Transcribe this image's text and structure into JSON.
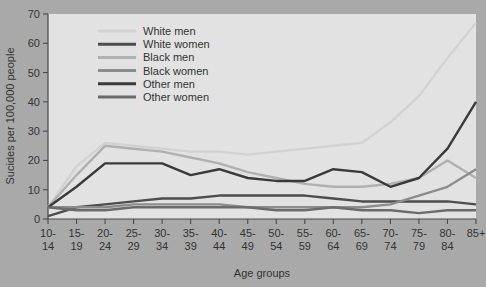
{
  "chart_data": {
    "type": "line",
    "title": "",
    "xlabel": "Age groups",
    "ylabel": "Sucides per 100,000 people",
    "ylim": [
      0,
      70
    ],
    "yticks": [
      0,
      10,
      20,
      30,
      40,
      50,
      60,
      70
    ],
    "grid": false,
    "legend_position": "top-center",
    "categories": [
      "10-\n14",
      "15-\n19",
      "20-\n24",
      "25-\n29",
      "30-\n34",
      "35-\n39",
      "40-\n44",
      "45-\n49",
      "50-\n54",
      "55-\n59",
      "60-\n64",
      "65-\n69",
      "70-\n74",
      "75-\n79",
      "80-\n84",
      "85+"
    ],
    "category_lines": [
      [
        "10-",
        "14"
      ],
      [
        "15-",
        "19"
      ],
      [
        "20-",
        "24"
      ],
      [
        "25-",
        "29"
      ],
      [
        "30-",
        "34"
      ],
      [
        "35-",
        "39"
      ],
      [
        "40-",
        "44"
      ],
      [
        "45-",
        "49"
      ],
      [
        "50-",
        "54"
      ],
      [
        "55-",
        "59"
      ],
      [
        "60-",
        "64"
      ],
      [
        "65-",
        "69"
      ],
      [
        "70-",
        "74"
      ],
      [
        "75-",
        "79"
      ],
      [
        "80-",
        "84"
      ],
      [
        "85+",
        ""
      ]
    ],
    "series": [
      {
        "name": "White men",
        "color": "#d2d2d2",
        "values": [
          4,
          18,
          26,
          25,
          24,
          23,
          23,
          22,
          23,
          24,
          25,
          26,
          33,
          42,
          55,
          67
        ]
      },
      {
        "name": "White women",
        "color": "#4d4d4d",
        "values": [
          1,
          4,
          5,
          6,
          7,
          7,
          8,
          8,
          8,
          8,
          7,
          6,
          6,
          6,
          6,
          5
        ]
      },
      {
        "name": "Black men",
        "color": "#b0b0b0",
        "values": [
          4,
          15,
          25,
          24,
          23,
          21,
          19,
          16,
          14,
          12,
          11,
          11,
          12,
          14,
          20,
          14
        ]
      },
      {
        "name": "Black women",
        "color": "#8c8c8c",
        "values": [
          4,
          4,
          4,
          5,
          5,
          5,
          5,
          4,
          4,
          4,
          4,
          4,
          5,
          8,
          11,
          17
        ]
      },
      {
        "name": "Other men",
        "color": "#3a3a3a",
        "values": [
          4,
          11,
          19,
          19,
          19,
          15,
          17,
          14,
          13,
          13,
          17,
          16,
          11,
          14,
          24,
          40
        ]
      },
      {
        "name": "Other women",
        "color": "#6b6b6b",
        "values": [
          4,
          3,
          3,
          4,
          4,
          4,
          4,
          4,
          3,
          3,
          4,
          3,
          3,
          2,
          3,
          3
        ]
      }
    ]
  },
  "axes": {
    "y_tick_labels": [
      "0",
      "10",
      "20",
      "30",
      "40",
      "50",
      "60",
      "70"
    ],
    "y_axis_title": "Sucides per 100,000 people",
    "x_axis_title": "Age groups"
  }
}
